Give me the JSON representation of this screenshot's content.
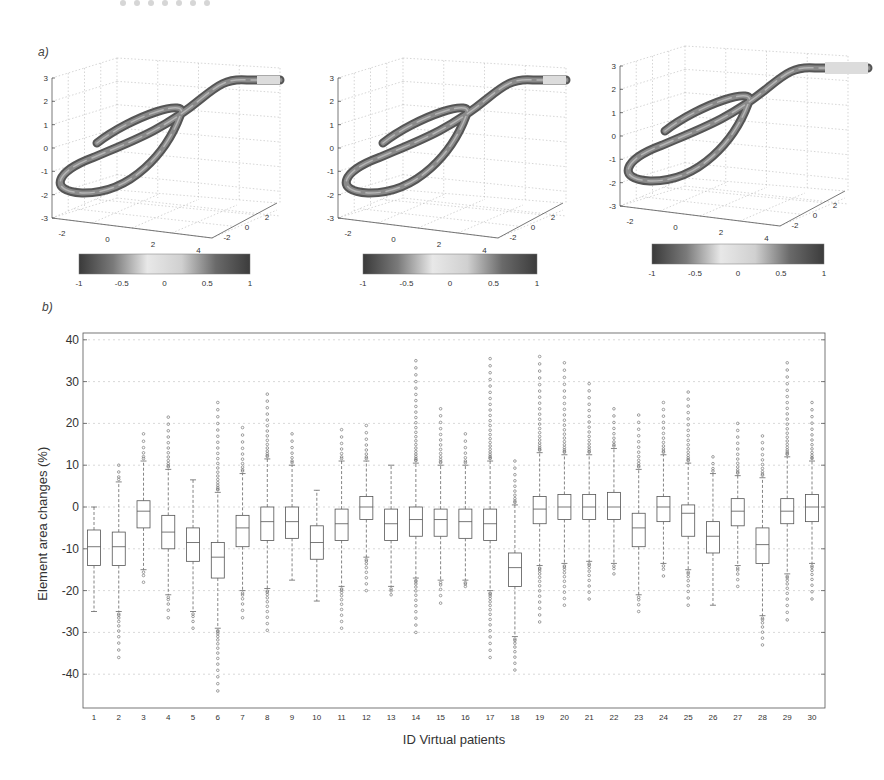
{
  "figure": {
    "panel_a_label": "a)",
    "panel_b_label": "b)"
  },
  "colorbar": {
    "ticks": [
      "-1",
      "-0.5",
      "0",
      "0.5",
      "1"
    ],
    "gradient": [
      "#3a3a3a",
      "#7a7a7a",
      "#e8e8e8",
      "#d0d0d0",
      "#6a6a6a",
      "#3c3c3c"
    ]
  },
  "panel_a": {
    "plots": [
      {
        "name": "3d-plot-1",
        "z_ticks": [
          "3",
          "2",
          "1",
          "0",
          "-1",
          "-2",
          "-3"
        ],
        "x_ticks": [
          "-2",
          "0",
          "2",
          "4"
        ],
        "y_ticks": [
          "-2",
          "0",
          "2"
        ]
      },
      {
        "name": "3d-plot-2",
        "z_ticks": [
          "3",
          "2",
          "1",
          "0",
          "-1",
          "-2",
          "-3"
        ],
        "x_ticks": [
          "-2",
          "0",
          "2",
          "4"
        ],
        "y_ticks": [
          "-2",
          "0",
          "2"
        ]
      },
      {
        "name": "3d-plot-3",
        "z_ticks": [
          "3",
          "2",
          "1",
          "0",
          "-1",
          "-2",
          "-3"
        ],
        "x_ticks": [
          "-2",
          "0",
          "2",
          "4"
        ],
        "y_ticks": [
          "-2",
          "0",
          "2"
        ]
      }
    ]
  },
  "chart_data": [
    {
      "type": "surface-3d",
      "title": "",
      "description": "Three 3D tube renderings of a looping vessel centerline, colored by a -1..1 colormap",
      "zlim": [
        -3,
        3
      ],
      "xlim": [
        -3,
        5
      ],
      "ylim": [
        -2,
        2
      ],
      "z_ticks": [
        3,
        2,
        1,
        0,
        -1,
        -2,
        -3
      ],
      "x_ticks": [
        -2,
        0,
        2,
        4
      ],
      "y_ticks": [
        -2,
        0,
        2
      ],
      "colorbar": {
        "range": [
          -1,
          1
        ],
        "ticks": [
          -1,
          -0.5,
          0,
          0.5,
          1
        ]
      },
      "grid": true
    },
    {
      "type": "box",
      "title": "",
      "xlabel": "ID Virtual patients",
      "ylabel": "Element area changes (%)",
      "ylim": [
        -48,
        41
      ],
      "y_ticks": [
        40,
        30,
        20,
        10,
        0,
        -10,
        -20,
        -30,
        -40
      ],
      "grid": true,
      "categories": [
        "1",
        "2",
        "3",
        "4",
        "5",
        "6",
        "7",
        "8",
        "9",
        "10",
        "11",
        "12",
        "13",
        "14",
        "15",
        "16",
        "17",
        "18",
        "19",
        "20",
        "21",
        "22",
        "23",
        "24",
        "25",
        "26",
        "27",
        "28",
        "29",
        "30"
      ],
      "boxes": [
        {
          "q1": -14,
          "median": -9.5,
          "q3": -5.5,
          "whisker_low": -25,
          "whisker_high": 0,
          "outlier_max": null,
          "outlier_min": null
        },
        {
          "q1": -14,
          "median": -9.5,
          "q3": -6,
          "whisker_low": -25,
          "whisker_high": 6,
          "outlier_max": 10,
          "outlier_min": -36
        },
        {
          "q1": -5,
          "median": -1,
          "q3": 1.5,
          "whisker_low": -15,
          "whisker_high": 11,
          "outlier_max": 17.5,
          "outlier_min": -18
        },
        {
          "q1": -10,
          "median": -6,
          "q3": -2,
          "whisker_low": -21,
          "whisker_high": 9,
          "outlier_max": 21.5,
          "outlier_min": -26.5
        },
        {
          "q1": -13,
          "median": -8.5,
          "q3": -5,
          "whisker_low": -25,
          "whisker_high": 6.5,
          "outlier_max": null,
          "outlier_min": -29
        },
        {
          "q1": -17,
          "median": -12,
          "q3": -8.5,
          "whisker_low": -29,
          "whisker_high": 3.5,
          "outlier_max": 25,
          "outlier_min": -44
        },
        {
          "q1": -9.5,
          "median": -5,
          "q3": -2,
          "whisker_low": -20,
          "whisker_high": 8,
          "outlier_max": 19,
          "outlier_min": -26.5
        },
        {
          "q1": -8,
          "median": -3.5,
          "q3": 0,
          "whisker_low": -19.5,
          "whisker_high": 11.5,
          "outlier_max": 27,
          "outlier_min": -29.5
        },
        {
          "q1": -7.5,
          "median": -3.5,
          "q3": 0,
          "whisker_low": -17.5,
          "whisker_high": 10,
          "outlier_max": 17.5,
          "outlier_min": null
        },
        {
          "q1": -12.5,
          "median": -8.5,
          "q3": -4.5,
          "whisker_low": -22.5,
          "whisker_high": 4,
          "outlier_max": null,
          "outlier_min": null
        },
        {
          "q1": -8,
          "median": -4,
          "q3": -0.5,
          "whisker_low": -19,
          "whisker_high": 11,
          "outlier_max": 18.5,
          "outlier_min": -29
        },
        {
          "q1": -3,
          "median": 0,
          "q3": 2.5,
          "whisker_low": -12,
          "whisker_high": 11,
          "outlier_max": 19.5,
          "outlier_min": -20
        },
        {
          "q1": -8,
          "median": -4,
          "q3": -0.5,
          "whisker_low": -19,
          "whisker_high": 10,
          "outlier_max": null,
          "outlier_min": -21
        },
        {
          "q1": -7,
          "median": -3,
          "q3": 0,
          "whisker_low": -17,
          "whisker_high": 10.5,
          "outlier_max": 35,
          "outlier_min": -30
        },
        {
          "q1": -7,
          "median": -3,
          "q3": -0.5,
          "whisker_low": -17.5,
          "whisker_high": 10,
          "outlier_max": 23.5,
          "outlier_min": -23
        },
        {
          "q1": -7.5,
          "median": -3.5,
          "q3": -0.5,
          "whisker_low": -17.5,
          "whisker_high": 10,
          "outlier_max": 17.5,
          "outlier_min": -19
        },
        {
          "q1": -8,
          "median": -4,
          "q3": -0.5,
          "whisker_low": -20,
          "whisker_high": 11,
          "outlier_max": 35.5,
          "outlier_min": -36
        },
        {
          "q1": -19,
          "median": -14.5,
          "q3": -11,
          "whisker_low": -31,
          "whisker_high": 0.5,
          "outlier_max": 11,
          "outlier_min": -39
        },
        {
          "q1": -4,
          "median": -0.5,
          "q3": 2.5,
          "whisker_low": -14,
          "whisker_high": 13,
          "outlier_max": 36,
          "outlier_min": -27.5
        },
        {
          "q1": -3,
          "median": 0,
          "q3": 3,
          "whisker_low": -13.5,
          "whisker_high": 12.5,
          "outlier_max": 34.5,
          "outlier_min": -23.5
        },
        {
          "q1": -3,
          "median": 0,
          "q3": 3,
          "whisker_low": -13,
          "whisker_high": 12.5,
          "outlier_max": 29.5,
          "outlier_min": -22
        },
        {
          "q1": -3,
          "median": 0,
          "q3": 3.5,
          "whisker_low": -13.5,
          "whisker_high": 14,
          "outlier_max": 23.5,
          "outlier_min": -16
        },
        {
          "q1": -9.5,
          "median": -5,
          "q3": -1.5,
          "whisker_low": -21,
          "whisker_high": 9,
          "outlier_max": 22,
          "outlier_min": -25
        },
        {
          "q1": -3.5,
          "median": 0,
          "q3": 2.5,
          "whisker_low": -13.5,
          "whisker_high": 12.5,
          "outlier_max": 25,
          "outlier_min": -16.5
        },
        {
          "q1": -7,
          "median": -1.5,
          "q3": 0.5,
          "whisker_low": -15,
          "whisker_high": 10.5,
          "outlier_max": 27.5,
          "outlier_min": -23.5
        },
        {
          "q1": -11,
          "median": -7,
          "q3": -3.5,
          "whisker_low": -23.5,
          "whisker_high": 8,
          "outlier_max": 12,
          "outlier_min": null
        },
        {
          "q1": -4.5,
          "median": -1,
          "q3": 2,
          "whisker_low": -14,
          "whisker_high": 7.5,
          "outlier_max": 20,
          "outlier_min": -19
        },
        {
          "q1": -13.5,
          "median": -9,
          "q3": -5,
          "whisker_low": -26,
          "whisker_high": 7,
          "outlier_max": 17,
          "outlier_min": -33
        },
        {
          "q1": -4,
          "median": -1,
          "q3": 2,
          "whisker_low": -16,
          "whisker_high": 12,
          "outlier_max": 34.5,
          "outlier_min": -27
        },
        {
          "q1": -3.5,
          "median": 0,
          "q3": 3,
          "whisker_low": -13.5,
          "whisker_high": 11,
          "outlier_max": 25,
          "outlier_min": -22
        }
      ]
    }
  ]
}
